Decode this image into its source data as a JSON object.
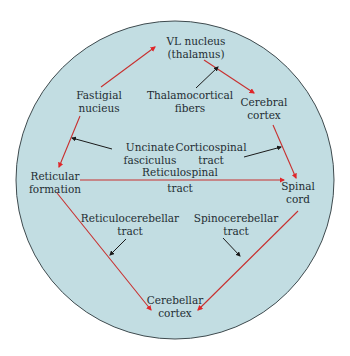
{
  "diagram": {
    "colors": {
      "background": "#ffffff",
      "circle_fill": "#c2dde2",
      "circle_stroke": "#3e4a4e",
      "pathway_arrow": "#c8302f",
      "pointer_arrow": "#1a1a1a",
      "text": "#1f2d33"
    },
    "nodes": {
      "vl_nucleus": {
        "line1": "VL nucleus",
        "line2": "(thalamus)"
      },
      "fastigial_nucleus": {
        "line1": "Fastigial",
        "line2": "nucieus"
      },
      "cerebral_cortex": {
        "line1": "Cerebral",
        "line2": "cortex"
      },
      "reticular_formation": {
        "line1": "Reticular",
        "line2": "formation"
      },
      "spinal_cord": {
        "line1": "Spinal",
        "line2": "cord"
      },
      "cerebellar_cortex": {
        "line1": "Cerebellar",
        "line2": "cortex"
      }
    },
    "tract_labels": {
      "thalamocortical": {
        "line1": "Thalamocortical",
        "line2": "fibers"
      },
      "uncinate": {
        "line1": "Uncinate",
        "line2": "fasciculus"
      },
      "corticospinal": {
        "line1": "Corticospinal",
        "line2": "tract"
      },
      "reticulospinal": {
        "line1": "Reticulospinal",
        "line2": "tract"
      },
      "reticulocerebellar": {
        "line1": "Reticulocerebellar",
        "line2": "tract"
      },
      "spinocerebellar": {
        "line1": "Spinocerebellar",
        "line2": "tract"
      }
    },
    "connections": [
      {
        "from": "Fastigial nucieus",
        "to": "VL nucleus (thalamus)",
        "tract": "Thalamocortical-adjacent ascending path"
      },
      {
        "from": "VL nucleus (thalamus)",
        "to": "Cerebral cortex",
        "tract": "Thalamocortical fibers"
      },
      {
        "from": "Cerebral cortex",
        "to": "Spinal cord",
        "tract": "Corticospinal tract"
      },
      {
        "from": "Fastigial nucieus",
        "to": "Reticular formation",
        "tract": "Uncinate fasciculus"
      },
      {
        "from": "Reticular formation",
        "to": "Spinal cord",
        "tract": "Reticulospinal tract"
      },
      {
        "from": "Reticular formation",
        "to": "Cerebellar cortex",
        "tract": "Reticulocerebellar tract"
      },
      {
        "from": "Spinal cord",
        "to": "Cerebellar cortex",
        "tract": "Spinocerebellar tract"
      }
    ]
  }
}
